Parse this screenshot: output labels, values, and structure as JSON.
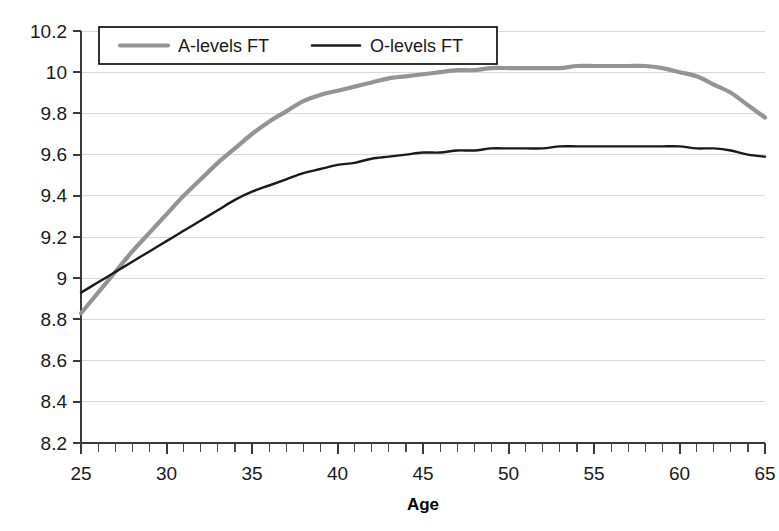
{
  "chart_data": {
    "type": "line",
    "title": "",
    "xlabel": "Age",
    "ylabel": "",
    "xlim": [
      25,
      65
    ],
    "ylim": [
      8.2,
      10.2
    ],
    "grid": true,
    "legend_position": "top-left",
    "x_ticks": [
      25,
      30,
      35,
      40,
      45,
      50,
      55,
      60,
      65
    ],
    "x_tick_labels": [
      "25",
      "30",
      "35",
      "40",
      "45",
      "50",
      "55",
      "60",
      "65"
    ],
    "x_minor_tick_step": 1,
    "y_ticks": [
      8.2,
      8.4,
      8.6,
      8.8,
      9,
      9.2,
      9.4,
      9.6,
      9.8,
      10,
      10.2
    ],
    "y_tick_labels": [
      "8.2",
      "8.4",
      "8.6",
      "8.8",
      "9",
      "9.2",
      "9.4",
      "9.6",
      "9.8",
      "10",
      "10.2"
    ],
    "x": [
      25,
      26,
      27,
      28,
      29,
      30,
      31,
      32,
      33,
      34,
      35,
      36,
      37,
      38,
      39,
      40,
      41,
      42,
      43,
      44,
      45,
      46,
      47,
      48,
      49,
      50,
      51,
      52,
      53,
      54,
      55,
      56,
      57,
      58,
      59,
      60,
      61,
      62,
      63,
      64,
      65
    ],
    "series": [
      {
        "name": "A-levels FT",
        "color": "#949494",
        "width": 4.2,
        "values": [
          8.83,
          8.93,
          9.03,
          9.13,
          9.22,
          9.31,
          9.4,
          9.48,
          9.56,
          9.63,
          9.7,
          9.76,
          9.81,
          9.86,
          9.89,
          9.91,
          9.93,
          9.95,
          9.97,
          9.98,
          9.99,
          10.0,
          10.01,
          10.01,
          10.02,
          10.02,
          10.02,
          10.02,
          10.02,
          10.03,
          10.03,
          10.03,
          10.03,
          10.03,
          10.02,
          10.0,
          9.98,
          9.94,
          9.9,
          9.84,
          9.78
        ]
      },
      {
        "name": "O-levels FT",
        "color": "#1a1a1a",
        "width": 2.4,
        "values": [
          8.93,
          8.98,
          9.03,
          9.08,
          9.13,
          9.18,
          9.23,
          9.28,
          9.33,
          9.38,
          9.42,
          9.45,
          9.48,
          9.51,
          9.53,
          9.55,
          9.56,
          9.58,
          9.59,
          9.6,
          9.61,
          9.61,
          9.62,
          9.62,
          9.63,
          9.63,
          9.63,
          9.63,
          9.64,
          9.64,
          9.64,
          9.64,
          9.64,
          9.64,
          9.64,
          9.64,
          9.63,
          9.63,
          9.62,
          9.6,
          9.59
        ]
      }
    ],
    "annotations": []
  },
  "legend": {
    "entries": [
      {
        "label": "A-levels FT",
        "color": "#949494"
      },
      {
        "label": "O-levels FT",
        "color": "#1a1a1a"
      }
    ]
  },
  "axis": {
    "x_title": "Age"
  }
}
